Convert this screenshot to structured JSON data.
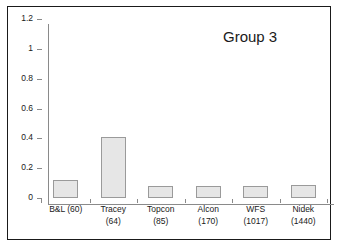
{
  "chart_data": {
    "type": "bar",
    "title": "Group 3",
    "xlabel": "",
    "ylabel": "",
    "categories": [
      "B&L (60)",
      "Tracey\n(64)",
      "Topcon\n(85)",
      "Alcon\n(170)",
      "WFS\n(1017)",
      "Nidek\n(1440)"
    ],
    "values": [
      0.12,
      0.41,
      0.08,
      0.08,
      0.08,
      0.09
    ],
    "ylim": [
      0,
      1.2
    ],
    "yticks": [
      0,
      0.2,
      0.4,
      0.6,
      0.8,
      1,
      1.2
    ],
    "ytick_labels": [
      "0",
      "0.2",
      "0.4",
      "0.6",
      "0.8",
      "1",
      "1.2"
    ],
    "grid": false,
    "legend": false,
    "bar_color": "#e6e6e6",
    "bar_border_color": "#9a9a9a",
    "axis_color": "#8a8a8a",
    "frame_color": "#1a1a1a",
    "background": "#ffffff"
  }
}
